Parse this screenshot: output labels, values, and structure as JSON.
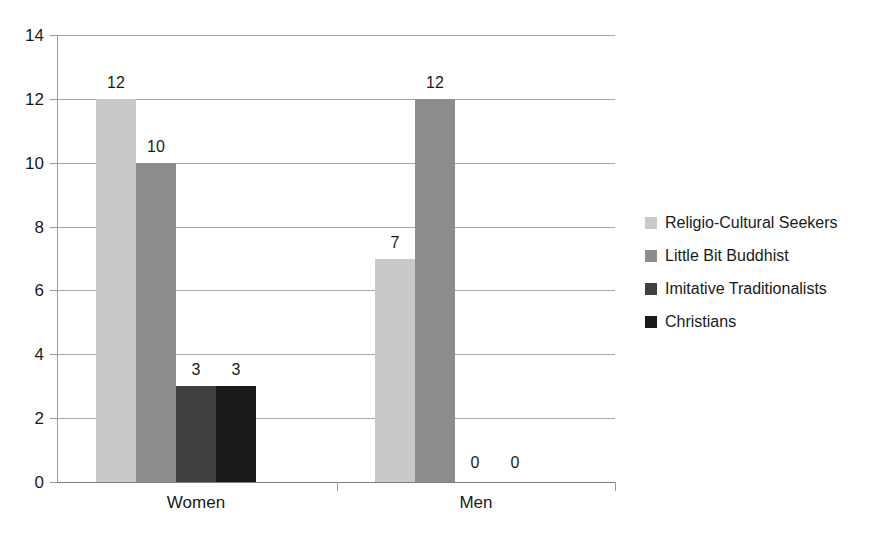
{
  "chart_data": {
    "type": "bar",
    "title": "",
    "subtitle": "",
    "xlabel": "",
    "ylabel": "",
    "categories": [
      "Women",
      "Men"
    ],
    "series": [
      {
        "name": "Religio-Cultural Seekers",
        "color": "#c9c9c9",
        "values": [
          12,
          7
        ]
      },
      {
        "name": "Little Bit Buddhist",
        "color": "#8c8c8c",
        "values": [
          10,
          12
        ]
      },
      {
        "name": "Imitative Traditionalists",
        "color": "#404040",
        "values": [
          3,
          0
        ]
      },
      {
        "name": "Christians",
        "color": "#1a1a1a",
        "values": [
          3,
          0
        ]
      }
    ],
    "ylim": [
      0,
      14
    ],
    "yticks": [
      0,
      2,
      4,
      6,
      8,
      10,
      12,
      14
    ],
    "ytick_labels": [
      "0",
      "2",
      "4",
      "6",
      "8",
      "10",
      "12",
      "14"
    ],
    "data_labels": [
      [
        "12",
        "10",
        "3",
        "3"
      ],
      [
        "7",
        "12",
        "0",
        "0"
      ]
    ],
    "grid": true,
    "grid_axis": "y",
    "legend_position": "right",
    "bar_gap": 0,
    "value_labels_shown": true
  },
  "axis": {
    "y_axis_name": "value-axis",
    "x_axis_name": "category-axis"
  }
}
